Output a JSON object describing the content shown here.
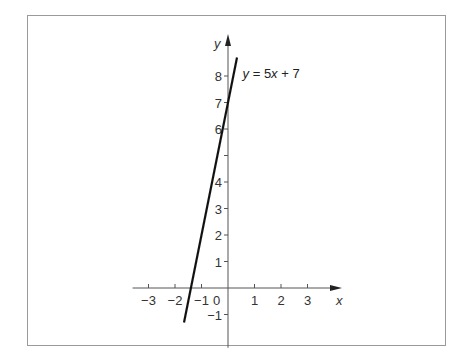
{
  "chart_data": {
    "type": "line",
    "title": "",
    "xlabel": "x",
    "ylabel": "y",
    "xlim": [
      -3.6,
      4.3
    ],
    "ylim": [
      -1.5,
      9.6
    ],
    "grid": false,
    "legend": "none",
    "x_ticks": [
      -3,
      -2,
      -1,
      1,
      2,
      3
    ],
    "x_tick_labels": [
      "−3",
      "−2",
      "−1",
      "1",
      "2",
      "3"
    ],
    "y_ticks": [
      -1,
      1,
      2,
      3,
      4,
      5,
      6,
      7,
      8
    ],
    "y_tick_labels": [
      "−1",
      "1",
      "2",
      "3",
      "",
      "4",
      "",
      "6",
      "7",
      "8"
    ],
    "origin_label": "0",
    "series": [
      {
        "name": "y = 5x + 7",
        "equation": {
          "slope": 5,
          "intercept": 7
        },
        "x": [
          -1.66,
          0.34
        ],
        "y": [
          -1.3,
          8.7
        ]
      }
    ],
    "annotations": [
      {
        "text_parts": [
          "y",
          " = 5",
          "x",
          " + 7"
        ],
        "anchor_x": 0.55,
        "anchor_y": 8.1
      }
    ],
    "y_tick_label_map": {
      "-1": "−1",
      "1": "1",
      "2": "2",
      "3": "3",
      "4": "4",
      "5": "",
      "6": "6",
      "7": "7",
      "8": "8"
    }
  }
}
